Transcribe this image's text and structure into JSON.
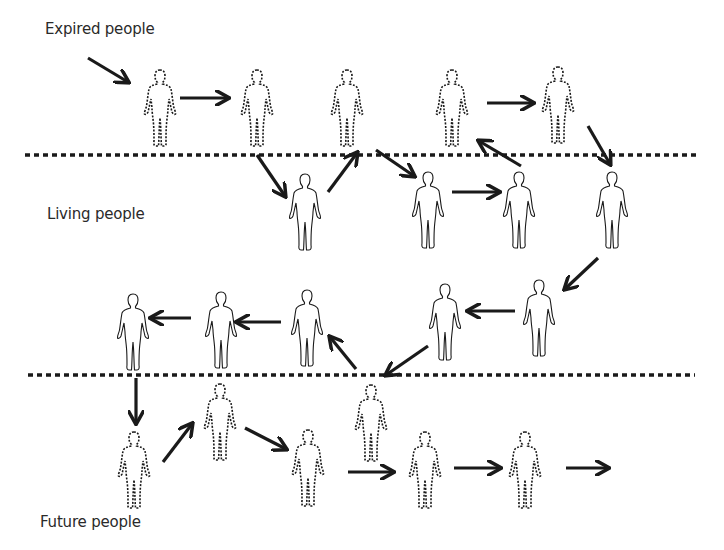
{
  "labels": {
    "expired": "Expired people",
    "living": "Living people",
    "future": "Future people"
  },
  "colors": {
    "ink": "#1a1a1a",
    "text": "#2a2a2a",
    "background": "#ffffff"
  },
  "boundaries": [
    {
      "name": "expired-living-boundary",
      "y": 155,
      "x1": 25,
      "x2": 700
    },
    {
      "name": "living-future-boundary",
      "y": 375,
      "x1": 28,
      "x2": 695
    }
  ],
  "figures": [
    {
      "group": "expired",
      "cx": 160,
      "top": 68,
      "style": "dashed"
    },
    {
      "group": "expired",
      "cx": 257,
      "top": 68,
      "style": "dashed"
    },
    {
      "group": "expired",
      "cx": 347,
      "top": 68,
      "style": "dashed"
    },
    {
      "group": "expired",
      "cx": 452,
      "top": 68,
      "style": "dashed"
    },
    {
      "group": "expired",
      "cx": 558,
      "top": 65,
      "style": "dashed"
    },
    {
      "group": "living",
      "cx": 305,
      "top": 172,
      "style": "solid"
    },
    {
      "group": "living",
      "cx": 428,
      "top": 170,
      "style": "solid"
    },
    {
      "group": "living",
      "cx": 519,
      "top": 170,
      "style": "solid"
    },
    {
      "group": "living",
      "cx": 612,
      "top": 170,
      "style": "solid"
    },
    {
      "group": "living",
      "cx": 539,
      "top": 278,
      "style": "solid"
    },
    {
      "group": "living",
      "cx": 445,
      "top": 282,
      "style": "solid"
    },
    {
      "group": "living",
      "cx": 307,
      "top": 288,
      "style": "solid"
    },
    {
      "group": "living",
      "cx": 221,
      "top": 290,
      "style": "solid"
    },
    {
      "group": "living",
      "cx": 133,
      "top": 292,
      "style": "solid"
    },
    {
      "group": "future",
      "cx": 134,
      "top": 430,
      "style": "dashed"
    },
    {
      "group": "future",
      "cx": 220,
      "top": 382,
      "style": "dashed"
    },
    {
      "group": "future",
      "cx": 308,
      "top": 428,
      "style": "dashed"
    },
    {
      "group": "future",
      "cx": 371,
      "top": 383,
      "style": "dashed"
    },
    {
      "group": "future",
      "cx": 425,
      "top": 430,
      "style": "dashed"
    },
    {
      "group": "future",
      "cx": 525,
      "top": 430,
      "style": "dashed"
    }
  ],
  "arrows": [
    {
      "x1": 88,
      "y1": 58,
      "x2": 128,
      "y2": 82
    },
    {
      "x1": 180,
      "y1": 98,
      "x2": 228,
      "y2": 98
    },
    {
      "x1": 257,
      "y1": 155,
      "x2": 285,
      "y2": 196
    },
    {
      "x1": 328,
      "y1": 192,
      "x2": 357,
      "y2": 153
    },
    {
      "x1": 376,
      "y1": 150,
      "x2": 414,
      "y2": 176
    },
    {
      "x1": 452,
      "y1": 192,
      "x2": 499,
      "y2": 192
    },
    {
      "x1": 521,
      "y1": 166,
      "x2": 479,
      "y2": 141
    },
    {
      "x1": 487,
      "y1": 103,
      "x2": 533,
      "y2": 103
    },
    {
      "x1": 588,
      "y1": 126,
      "x2": 610,
      "y2": 164
    },
    {
      "x1": 598,
      "y1": 258,
      "x2": 565,
      "y2": 289
    },
    {
      "x1": 515,
      "y1": 311,
      "x2": 468,
      "y2": 311
    },
    {
      "x1": 428,
      "y1": 346,
      "x2": 386,
      "y2": 375
    },
    {
      "x1": 356,
      "y1": 369,
      "x2": 330,
      "y2": 337
    },
    {
      "x1": 281,
      "y1": 322,
      "x2": 237,
      "y2": 322
    },
    {
      "x1": 191,
      "y1": 318,
      "x2": 151,
      "y2": 318
    },
    {
      "x1": 136,
      "y1": 378,
      "x2": 136,
      "y2": 423
    },
    {
      "x1": 163,
      "y1": 462,
      "x2": 192,
      "y2": 424
    },
    {
      "x1": 245,
      "y1": 428,
      "x2": 286,
      "y2": 449
    },
    {
      "x1": 348,
      "y1": 472,
      "x2": 393,
      "y2": 472
    },
    {
      "x1": 454,
      "y1": 468,
      "x2": 500,
      "y2": 468
    },
    {
      "x1": 566,
      "y1": 468,
      "x2": 608,
      "y2": 468
    }
  ]
}
